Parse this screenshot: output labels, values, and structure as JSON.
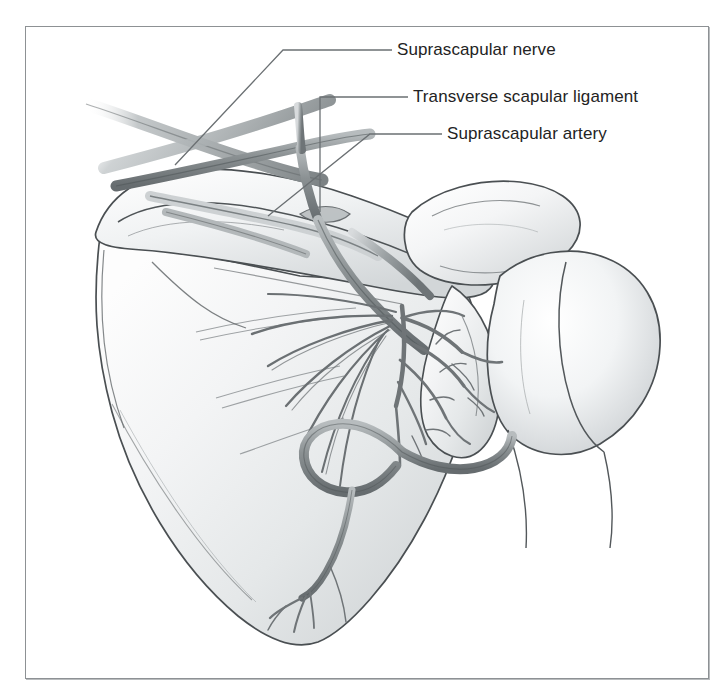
{
  "figure": {
    "kind": "anatomical-illustration",
    "frame": {
      "border_color": "#8d9194",
      "background": "#ffffff"
    }
  },
  "palette": {
    "bone_fill": "#eef0f1",
    "bone_shadow": "#c3c7c9",
    "bone_highlight": "#ffffff",
    "outline": "#4a4f52",
    "vessel_dark": "#6f7476",
    "vessel_mid": "#9aa0a2",
    "vessel_light": "#c9cdcf",
    "label_text": "#232323",
    "leader_line": "#6b7073"
  },
  "labels": [
    {
      "id": "suprascapular-nerve",
      "text": "Suprascapular nerve",
      "x": 397,
      "y": 41,
      "leader": "M 392 50 L 283 50 L 175 165"
    },
    {
      "id": "transverse-scapular-ligament",
      "text": "Transverse scapular ligament",
      "x": 413,
      "y": 88,
      "leader": "M 408 97 L 320 97 L 320 212"
    },
    {
      "id": "suprascapular-artery",
      "text": "Suprascapular artery",
      "x": 447,
      "y": 125,
      "leader": "M 442 134 L 370 134 L 268 216"
    }
  ],
  "structures": [
    {
      "name": "scapular-body",
      "region": "infraspinous fossa"
    },
    {
      "name": "scapular-spine",
      "region": "posterior ridge"
    },
    {
      "name": "acromion",
      "region": "lateral superior"
    },
    {
      "name": "humeral-head",
      "region": "right"
    },
    {
      "name": "glenoid-neck",
      "region": "lateral"
    },
    {
      "name": "suprascapular-notch",
      "region": "superior border"
    },
    {
      "name": "suprascapular-nerve-trunk",
      "region": "notch to fossa"
    },
    {
      "name": "suprascapular-artery-trunk",
      "region": "over ligament"
    },
    {
      "name": "nerve-branch-fan",
      "region": "infraspinous"
    },
    {
      "name": "arterial-anastomosis",
      "region": "infraspinous"
    },
    {
      "name": "circumflex-scapular-vessel",
      "region": "lateral border"
    },
    {
      "name": "descending-branch",
      "region": "inferior body"
    }
  ]
}
